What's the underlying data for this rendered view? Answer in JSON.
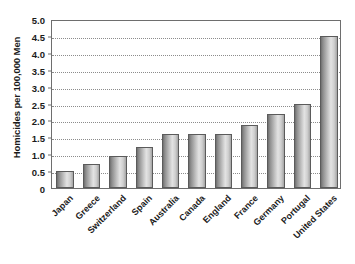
{
  "chart_data": {
    "type": "bar",
    "title": "",
    "xlabel": "",
    "ylabel": "Homicides per 100,000 Men",
    "ylim": [
      0,
      5.0
    ],
    "ytick_labels": [
      "5.0",
      "4.5",
      "4.0",
      "3.5",
      "3.0",
      "2.5",
      "2.0",
      "1.5",
      "1.0",
      "0.5",
      "0"
    ],
    "ytick_values": [
      5.0,
      4.5,
      4.0,
      3.5,
      3.0,
      2.5,
      2.0,
      1.5,
      1.0,
      0.5,
      0
    ],
    "grid": true,
    "grid_style": "dotted",
    "legend": false,
    "legend_position": "none",
    "categories": [
      "Japan",
      "Greece",
      "Switzerland",
      "Spain",
      "Australia",
      "Canada",
      "England",
      "France",
      "Germany",
      "Portugal",
      "United States"
    ],
    "values": [
      0.5,
      0.72,
      0.95,
      1.22,
      1.6,
      1.6,
      1.6,
      1.85,
      2.2,
      2.5,
      4.5
    ],
    "bar_color": "#c0c0c0",
    "bar_edge_color": "#5b5b5b",
    "axis_color": "#6e6e6e",
    "text_color": "#1a1a1a",
    "background_color": "#ffffff"
  }
}
